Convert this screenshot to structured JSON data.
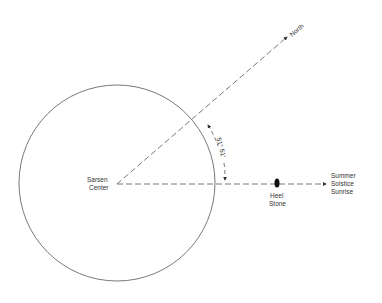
{
  "diagram": {
    "title": "",
    "labels": {
      "center": [
        "Sarsen",
        "Center"
      ],
      "north": "North",
      "heel_stone": [
        "Heel",
        "Stone"
      ],
      "sunrise": [
        "Summer",
        "Solstice",
        "Sunrise"
      ],
      "angle": "51° 51′"
    },
    "angle_degrees": 51,
    "angle_minutes": 51,
    "colors": {
      "line": "#555555",
      "text": "#333333",
      "stone": "#111111"
    }
  }
}
